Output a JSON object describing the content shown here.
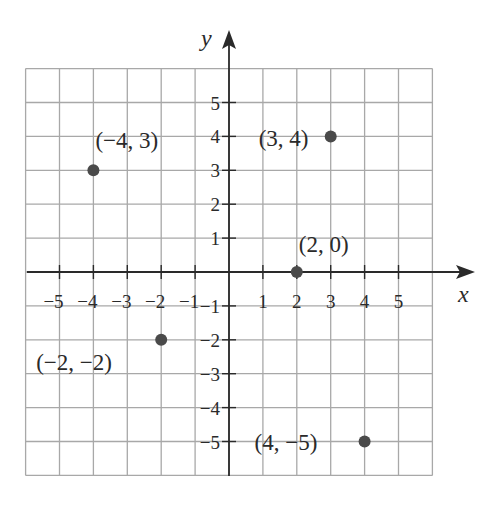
{
  "chart_data": {
    "type": "scatter",
    "title": "",
    "xlabel": "x",
    "ylabel": "y",
    "xlim": [
      -6,
      6
    ],
    "ylim": [
      -6,
      6
    ],
    "grid": true,
    "x_ticks": [
      -5,
      -4,
      -3,
      -2,
      -1,
      1,
      2,
      3,
      4,
      5
    ],
    "y_ticks": [
      5,
      4,
      3,
      2,
      1,
      -1,
      -2,
      -3,
      -4,
      -5
    ],
    "x_tick_labels": [
      "−5",
      "−4",
      "−3",
      "−2",
      "−1",
      "1",
      "2",
      "3",
      "4",
      "5"
    ],
    "y_tick_labels": [
      "5",
      "4",
      "3",
      "2",
      "1",
      "−1",
      "−2",
      "−3",
      "−4",
      "−5"
    ],
    "points": [
      {
        "x": -4,
        "y": 3,
        "label": "(−4, 3)"
      },
      {
        "x": 3,
        "y": 4,
        "label": "(3, 4)"
      },
      {
        "x": 2,
        "y": 0,
        "label": "(2, 0)"
      },
      {
        "x": -2,
        "y": -2,
        "label": "(−2, −2)"
      },
      {
        "x": 4,
        "y": -5,
        "label": "(4, −5)"
      }
    ],
    "point_color": "#4a4a4a"
  }
}
